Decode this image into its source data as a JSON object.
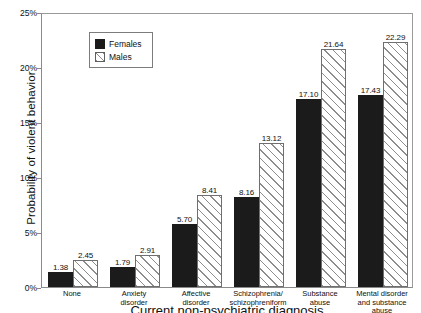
{
  "chart_data": {
    "type": "bar",
    "title": "",
    "xlabel": "Current non-psychiatric diagnosis",
    "ylabel": "Probability of violent behavior",
    "ylim": [
      0,
      25
    ],
    "ytick_labels": [
      "0%",
      "5%",
      "10%",
      "15%",
      "20%",
      "25%"
    ],
    "ytick_values": [
      0,
      5,
      10,
      15,
      20,
      25
    ],
    "grid": false,
    "legend_position": "top-left",
    "categories": [
      "None",
      "Anxiety disorder",
      "Affective disorder",
      "Schizophrenia/ schizophreniform",
      "Substance abuse",
      "Mental disorder and substance abuse"
    ],
    "category_lines": [
      [
        "None"
      ],
      [
        "Anxiety",
        "disorder"
      ],
      [
        "Affective",
        "disorder"
      ],
      [
        "Schizophrenia/",
        "schizophreniform"
      ],
      [
        "Substance",
        "abuse"
      ],
      [
        "Mental disorder",
        "and substance",
        "abuse"
      ]
    ],
    "series": [
      {
        "name": "Females",
        "fill": "solid",
        "color": "#1b1b1b",
        "values": [
          1.38,
          1.79,
          5.7,
          8.16,
          17.1,
          17.43
        ],
        "labels": [
          "1.38",
          "1.79",
          "5.70",
          "8.16",
          "17.10",
          "17.43"
        ]
      },
      {
        "name": "Males",
        "fill": "hatched",
        "color": "#ffffff",
        "values": [
          2.45,
          2.91,
          8.41,
          13.12,
          21.64,
          22.29
        ],
        "labels": [
          "2.45",
          "2.91",
          "8.41",
          "13.12",
          "21.64",
          "22.29"
        ]
      }
    ]
  },
  "legend": {
    "items": [
      {
        "label": "Females"
      },
      {
        "label": "Males"
      }
    ]
  }
}
